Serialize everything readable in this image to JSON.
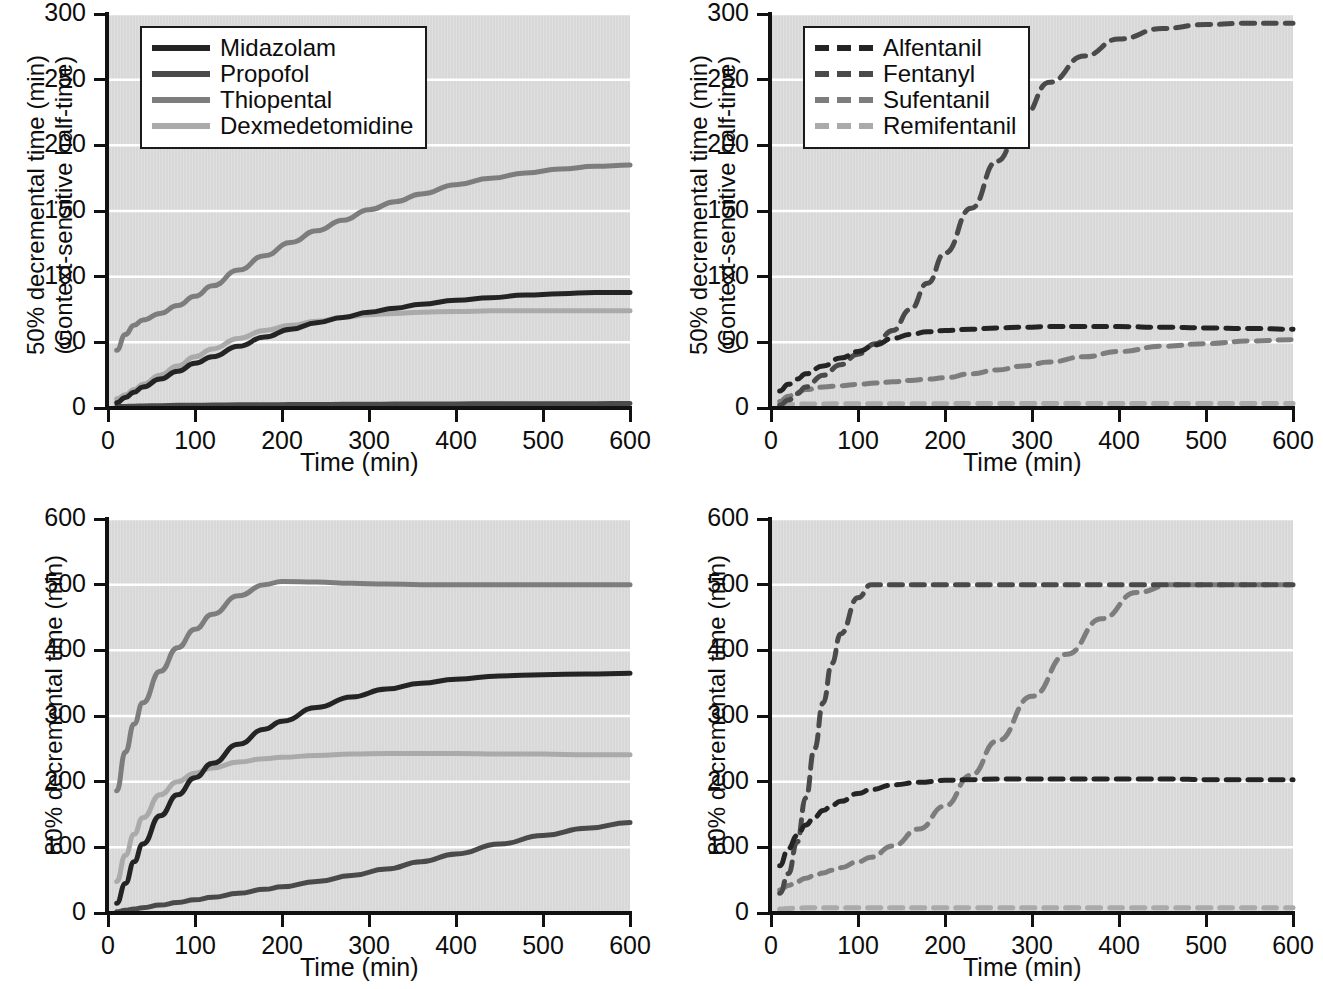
{
  "figure": {
    "axis_title_x": "Time (min)",
    "axis_title_y_50_line1": "50% decremental time (min)",
    "axis_title_y_50_line2": "(Context-sensitive half-time)",
    "axis_title_y_80": "80% decremental time (min)",
    "colors": {
      "plot_background": "#d8d8d8",
      "gridline": "#ffffff",
      "axis": "#111111",
      "series_1": "#242424",
      "series_2": "#4a4a4a",
      "series_3": "#7d7d7d",
      "series_4": "#aaaaaa"
    }
  },
  "chart_data": [
    {
      "id": "top-left",
      "type": "line",
      "title": "",
      "xlabel": "Time (min)",
      "ylabel": "50% decremental time (min) (Context-sensitive half-time)",
      "xlim": [
        0,
        600
      ],
      "ylim": [
        0,
        300
      ],
      "xticks": [
        0,
        100,
        200,
        300,
        400,
        500,
        600
      ],
      "yticks": [
        0,
        50,
        100,
        150,
        200,
        250,
        300
      ],
      "grid": true,
      "legend_position": "upper-left",
      "linestyle": "solid",
      "x": [
        10,
        20,
        30,
        40,
        60,
        80,
        100,
        120,
        150,
        180,
        210,
        240,
        270,
        300,
        330,
        360,
        400,
        440,
        480,
        520,
        560,
        600
      ],
      "series": [
        {
          "name": "Midazolam",
          "color": "#242424",
          "values": [
            4,
            8,
            12,
            16,
            22,
            28,
            34,
            39,
            47,
            54,
            60,
            65,
            69,
            73,
            76,
            79,
            82,
            84,
            86,
            87,
            88,
            88
          ]
        },
        {
          "name": "Propofol",
          "color": "#4a4a4a",
          "values": [
            1,
            1.2,
            1.4,
            1.6,
            1.8,
            2,
            2.1,
            2.2,
            2.4,
            2.5,
            2.6,
            2.7,
            2.8,
            2.9,
            3,
            3.0,
            3.1,
            3.2,
            3.2,
            3.3,
            3.3,
            3.4
          ]
        },
        {
          "name": "Thiopental",
          "color": "#7d7d7d",
          "values": [
            44,
            56,
            63,
            67,
            72,
            78,
            85,
            93,
            105,
            116,
            126,
            135,
            143,
            151,
            157,
            163,
            170,
            175,
            179,
            182,
            184,
            185
          ]
        },
        {
          "name": "Dexmedetomidine",
          "color": "#aaaaaa",
          "values": [
            7,
            10,
            14,
            18,
            25,
            32,
            39,
            45,
            53,
            59,
            63,
            66,
            69,
            71,
            72,
            73,
            73.5,
            74,
            74,
            74,
            74,
            74
          ]
        }
      ]
    },
    {
      "id": "top-right",
      "type": "line",
      "title": "",
      "xlabel": "Time (min)",
      "ylabel": "50% decremental time (min) (Context-sensitive half-time)",
      "xlim": [
        0,
        600
      ],
      "ylim": [
        0,
        300
      ],
      "xticks": [
        0,
        100,
        200,
        300,
        400,
        500,
        600
      ],
      "yticks": [
        0,
        50,
        100,
        150,
        200,
        250,
        300
      ],
      "grid": true,
      "legend_position": "upper-left",
      "linestyle": "dashed",
      "x": [
        10,
        20,
        30,
        40,
        60,
        80,
        100,
        120,
        140,
        160,
        180,
        200,
        230,
        260,
        290,
        320,
        360,
        400,
        450,
        500,
        550,
        600
      ],
      "series": [
        {
          "name": "Alfentanil",
          "color": "#242424",
          "values": [
            13,
            18,
            22,
            26,
            32,
            38,
            43,
            48,
            53,
            56,
            58,
            59,
            60,
            61,
            61.5,
            62,
            62,
            62,
            61.5,
            61,
            60.5,
            60
          ]
        },
        {
          "name": "Fentanyl",
          "color": "#4a4a4a",
          "values": [
            2,
            6,
            11,
            16,
            25,
            33,
            41,
            49,
            59,
            75,
            95,
            118,
            152,
            188,
            222,
            248,
            268,
            281,
            289,
            292,
            293,
            293
          ]
        },
        {
          "name": "Sufentanil",
          "color": "#7d7d7d",
          "values": [
            5,
            9,
            12,
            14,
            16,
            17,
            18,
            19,
            20,
            21,
            22,
            23,
            26,
            29,
            32,
            35,
            39,
            43,
            47,
            49,
            51,
            52
          ]
        },
        {
          "name": "Remifentanil",
          "color": "#aaaaaa",
          "values": [
            2.5,
            2.8,
            3,
            3,
            3.1,
            3.2,
            3.2,
            3.2,
            3.3,
            3.3,
            3.3,
            3.3,
            3.4,
            3.4,
            3.4,
            3.4,
            3.4,
            3.4,
            3.4,
            3.4,
            3.4,
            3.4
          ]
        }
      ]
    },
    {
      "id": "bottom-left",
      "type": "line",
      "title": "",
      "xlabel": "Time (min)",
      "ylabel": "80% decremental time (min)",
      "xlim": [
        0,
        600
      ],
      "ylim": [
        0,
        600
      ],
      "xticks": [
        0,
        100,
        200,
        300,
        400,
        500,
        600
      ],
      "yticks": [
        0,
        100,
        200,
        300,
        400,
        500,
        600
      ],
      "grid": true,
      "legend_position": "none",
      "linestyle": "solid",
      "x": [
        10,
        20,
        30,
        40,
        60,
        80,
        100,
        120,
        150,
        180,
        200,
        240,
        280,
        320,
        360,
        400,
        450,
        500,
        550,
        600
      ],
      "series": [
        {
          "name": "Midazolam",
          "color": "#242424",
          "values": [
            15,
            45,
            78,
            105,
            148,
            180,
            206,
            228,
            257,
            280,
            292,
            313,
            329,
            341,
            350,
            356,
            361,
            363,
            364,
            365
          ]
        },
        {
          "name": "Propofol",
          "color": "#4a4a4a",
          "values": [
            2,
            4,
            6,
            8,
            12,
            16,
            20,
            24,
            30,
            36,
            40,
            48,
            57,
            67,
            78,
            90,
            105,
            118,
            129,
            138
          ]
        },
        {
          "name": "Thiopental",
          "color": "#7d7d7d",
          "values": [
            186,
            245,
            288,
            320,
            368,
            404,
            432,
            455,
            483,
            500,
            505,
            504,
            502,
            501,
            500,
            500,
            500,
            500,
            500,
            500
          ]
        },
        {
          "name": "Dexmedetomidine",
          "color": "#aaaaaa",
          "values": [
            48,
            88,
            120,
            145,
            180,
            200,
            213,
            221,
            230,
            235,
            237,
            240,
            242,
            243,
            243,
            243,
            242,
            242,
            241,
            241
          ]
        }
      ]
    },
    {
      "id": "bottom-right",
      "type": "line",
      "title": "",
      "xlabel": "Time (min)",
      "ylabel": "80% decremental time (min)",
      "xlim": [
        0,
        600
      ],
      "ylim": [
        0,
        600
      ],
      "xticks": [
        0,
        100,
        200,
        300,
        400,
        500,
        600
      ],
      "yticks": [
        0,
        100,
        200,
        300,
        400,
        500,
        600
      ],
      "grid": true,
      "legend_position": "none",
      "linestyle": "dashed",
      "x": [
        10,
        20,
        30,
        40,
        50,
        60,
        70,
        80,
        100,
        115,
        140,
        170,
        200,
        230,
        260,
        300,
        340,
        380,
        420,
        460,
        500,
        550,
        600
      ],
      "series": [
        {
          "name": "Alfentanil",
          "color": "#242424",
          "values": [
            72,
            98,
            118,
            134,
            146,
            156,
            164,
            170,
            182,
            188,
            195,
            199,
            202,
            203,
            204,
            204,
            204,
            204,
            204,
            204,
            203,
            203,
            203
          ]
        },
        {
          "name": "Fentanyl",
          "color": "#4a4a4a",
          "values": [
            30,
            60,
            108,
            175,
            250,
            320,
            380,
            425,
            480,
            500,
            500,
            500,
            500,
            500,
            500,
            500,
            500,
            500,
            500,
            500,
            500,
            500,
            500
          ]
        },
        {
          "name": "Sufentanil",
          "color": "#7d7d7d",
          "values": [
            35,
            42,
            48,
            53,
            57,
            61,
            65,
            69,
            78,
            85,
            102,
            128,
            163,
            210,
            262,
            330,
            394,
            448,
            488,
            500,
            500,
            500,
            500
          ]
        },
        {
          "name": "Remifentanil",
          "color": "#aaaaaa",
          "values": [
            6,
            7,
            7.5,
            8,
            8,
            8,
            8,
            8,
            8,
            8,
            8,
            8,
            8,
            8,
            8,
            8,
            8,
            8,
            8,
            8,
            8,
            8,
            8
          ]
        }
      ]
    }
  ],
  "legends": [
    {
      "id": "legend-top-left",
      "items": [
        {
          "label": "Midazolam",
          "color": "#242424"
        },
        {
          "label": "Propofol",
          "color": "#4a4a4a"
        },
        {
          "label": "Thiopental",
          "color": "#7d7d7d"
        },
        {
          "label": "Dexmedetomidine",
          "color": "#aaaaaa"
        }
      ]
    },
    {
      "id": "legend-top-right",
      "items": [
        {
          "label": "Alfentanil",
          "color": "#242424"
        },
        {
          "label": "Fentanyl",
          "color": "#4a4a4a"
        },
        {
          "label": "Sufentanil",
          "color": "#7d7d7d"
        },
        {
          "label": "Remifentanil",
          "color": "#aaaaaa"
        }
      ]
    }
  ]
}
